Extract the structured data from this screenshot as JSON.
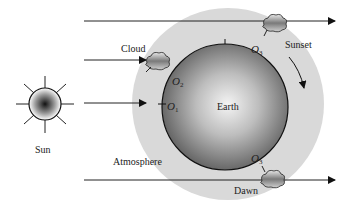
{
  "labels": {
    "sun": "Sun",
    "earth": "Earth",
    "atmosphere": "Atmosphere",
    "cloud": "Cloud",
    "sunset": "Sunset",
    "dawn": "Dawn"
  },
  "observers": [
    {
      "letter": "O",
      "sub": "1"
    },
    {
      "letter": "O",
      "sub": "2"
    },
    {
      "letter": "O",
      "sub": "3"
    },
    {
      "letter": "O",
      "sub": "3"
    }
  ],
  "colors": {
    "atmosphere": "#d9d9d9",
    "earth_center": "#f2f2f2",
    "earth_edge": "#5a5a5a",
    "line": "#222222"
  }
}
